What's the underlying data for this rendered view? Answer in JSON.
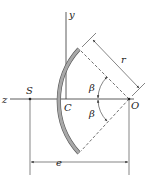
{
  "diagram": {
    "labels": {
      "y_axis": "y",
      "z_axis": "z",
      "shear_center": "S",
      "centroid": "C",
      "center_of_arc": "O",
      "radius": "r",
      "angle_upper": "β",
      "angle_lower": "β",
      "eccentricity": "e"
    },
    "colors": {
      "section_fill": "#a8a8a8",
      "section_stroke": "#555555",
      "line": "#333333"
    }
  }
}
